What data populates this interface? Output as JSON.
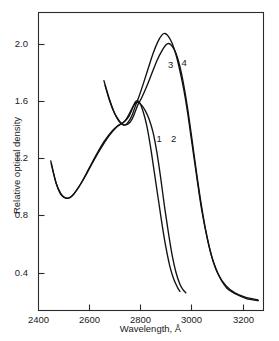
{
  "chart_data": {
    "type": "line",
    "title": "",
    "xlabel": "Wavelength, Å",
    "ylabel": "Relative optical density",
    "xlim": [
      2400,
      3280
    ],
    "ylim": [
      0.14,
      2.22
    ],
    "xticks": [
      2400,
      2600,
      2800,
      3000,
      3200
    ],
    "xtick_labels": [
      "2400",
      "2600",
      "2800",
      "3000",
      "3200"
    ],
    "yticks": [
      0.4,
      0.8,
      1.2,
      1.6,
      2.0
    ],
    "ytick_labels": [
      "0.4",
      "0.8",
      "1.2",
      "1.6",
      "2.0"
    ],
    "grid": false,
    "legend": "inline-curve-numbers",
    "line_color": "#111111",
    "series": [
      {
        "name": "1",
        "label": "1",
        "label_x": 2875,
        "label_y": 1.33,
        "points": [
          [
            2450,
            1.18
          ],
          [
            2470,
            1.03
          ],
          [
            2490,
            0.95
          ],
          [
            2510,
            0.92
          ],
          [
            2530,
            0.93
          ],
          [
            2560,
            1.0
          ],
          [
            2590,
            1.09
          ],
          [
            2620,
            1.19
          ],
          [
            2650,
            1.28
          ],
          [
            2680,
            1.36
          ],
          [
            2710,
            1.42
          ],
          [
            2735,
            1.45
          ],
          [
            2755,
            1.49
          ],
          [
            2770,
            1.55
          ],
          [
            2780,
            1.59
          ],
          [
            2790,
            1.6
          ],
          [
            2800,
            1.58
          ],
          [
            2812,
            1.52
          ],
          [
            2825,
            1.43
          ],
          [
            2840,
            1.28
          ],
          [
            2855,
            1.1
          ],
          [
            2870,
            0.92
          ],
          [
            2885,
            0.74
          ],
          [
            2900,
            0.58
          ],
          [
            2915,
            0.45
          ],
          [
            2930,
            0.36
          ],
          [
            2945,
            0.3
          ],
          [
            2955,
            0.27
          ]
        ]
      },
      {
        "name": "2",
        "label": "2",
        "label_x": 2932,
        "label_y": 1.33,
        "points": [
          [
            2452,
            1.16
          ],
          [
            2472,
            1.02
          ],
          [
            2492,
            0.94
          ],
          [
            2515,
            0.92
          ],
          [
            2540,
            0.95
          ],
          [
            2570,
            1.03
          ],
          [
            2600,
            1.13
          ],
          [
            2630,
            1.23
          ],
          [
            2660,
            1.32
          ],
          [
            2690,
            1.39
          ],
          [
            2715,
            1.43
          ],
          [
            2740,
            1.46
          ],
          [
            2760,
            1.52
          ],
          [
            2775,
            1.57
          ],
          [
            2790,
            1.59
          ],
          [
            2805,
            1.57
          ],
          [
            2820,
            1.53
          ],
          [
            2835,
            1.47
          ],
          [
            2850,
            1.38
          ],
          [
            2865,
            1.24
          ],
          [
            2880,
            1.06
          ],
          [
            2895,
            0.86
          ],
          [
            2910,
            0.68
          ],
          [
            2925,
            0.52
          ],
          [
            2940,
            0.4
          ],
          [
            2955,
            0.32
          ],
          [
            2968,
            0.28
          ],
          [
            2978,
            0.26
          ]
        ]
      },
      {
        "name": "3",
        "label": "3",
        "label_x": 2920,
        "label_y": 1.84,
        "points": [
          [
            2662,
            1.71
          ],
          [
            2680,
            1.6
          ],
          [
            2700,
            1.51
          ],
          [
            2720,
            1.45
          ],
          [
            2740,
            1.43
          ],
          [
            2760,
            1.45
          ],
          [
            2775,
            1.5
          ],
          [
            2790,
            1.57
          ],
          [
            2805,
            1.62
          ],
          [
            2825,
            1.7
          ],
          [
            2845,
            1.79
          ],
          [
            2865,
            1.88
          ],
          [
            2885,
            1.95
          ],
          [
            2900,
            1.99
          ],
          [
            2912,
            2.0
          ],
          [
            2925,
            1.98
          ],
          [
            2940,
            1.93
          ],
          [
            2955,
            1.84
          ],
          [
            2970,
            1.71
          ],
          [
            2985,
            1.55
          ],
          [
            3000,
            1.36
          ],
          [
            3020,
            1.1
          ],
          [
            3040,
            0.86
          ],
          [
            3060,
            0.66
          ],
          [
            3080,
            0.51
          ],
          [
            3105,
            0.39
          ],
          [
            3135,
            0.31
          ],
          [
            3170,
            0.26
          ],
          [
            3210,
            0.23
          ],
          [
            3260,
            0.21
          ]
        ]
      },
      {
        "name": "4",
        "label": "4",
        "label_x": 2973,
        "label_y": 1.86,
        "points": [
          [
            2658,
            1.74
          ],
          [
            2678,
            1.62
          ],
          [
            2698,
            1.52
          ],
          [
            2718,
            1.46
          ],
          [
            2736,
            1.43
          ],
          [
            2752,
            1.45
          ],
          [
            2768,
            1.5
          ],
          [
            2782,
            1.57
          ],
          [
            2795,
            1.63
          ],
          [
            2812,
            1.72
          ],
          [
            2830,
            1.82
          ],
          [
            2850,
            1.93
          ],
          [
            2868,
            2.01
          ],
          [
            2885,
            2.06
          ],
          [
            2897,
            2.07
          ],
          [
            2910,
            2.05
          ],
          [
            2925,
            2.0
          ],
          [
            2940,
            1.92
          ],
          [
            2955,
            1.81
          ],
          [
            2970,
            1.68
          ],
          [
            2985,
            1.52
          ],
          [
            3000,
            1.33
          ],
          [
            3020,
            1.08
          ],
          [
            3040,
            0.84
          ],
          [
            3062,
            0.64
          ],
          [
            3085,
            0.48
          ],
          [
            3110,
            0.37
          ],
          [
            3140,
            0.29
          ],
          [
            3175,
            0.25
          ],
          [
            3215,
            0.22
          ],
          [
            3262,
            0.205
          ]
        ]
      }
    ]
  },
  "axes": {
    "frame_color": "#2b2b2b"
  }
}
